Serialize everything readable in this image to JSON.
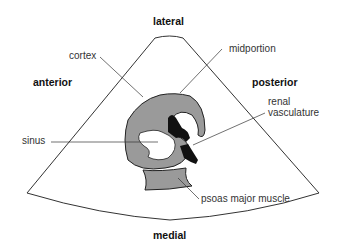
{
  "orientation_labels": {
    "top": "lateral",
    "left": "anterior",
    "right": "posterior",
    "bottom": "medial"
  },
  "structure_labels": {
    "cortex": "cortex",
    "midportion": "midportion",
    "renal_vasculature_line1": "renal",
    "renal_vasculature_line2": "vasculature",
    "sinus": "sinus",
    "psoas": "psoas major muscle"
  },
  "colors": {
    "kidney_fill": "#9a9a9a",
    "vessel_fill": "#111111",
    "outline": "#222222"
  }
}
